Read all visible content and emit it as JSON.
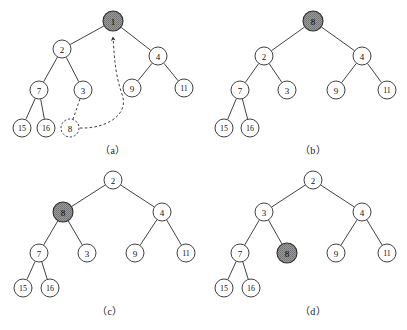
{
  "figure": {
    "width": 407,
    "height": 330,
    "background_color": "#ffffff",
    "line_color": "#2b2b2b",
    "shaded_node_fill": "#8c8c8c",
    "plain_node_fill": "#ffffff"
  },
  "panels": [
    {
      "id": "a",
      "caption": "（a）",
      "caption_x": 113,
      "caption_y": 150,
      "nodes": [
        {
          "id": "a-root",
          "label": "1",
          "x": 113,
          "y": 21,
          "r": 10,
          "style": "shaded"
        },
        {
          "id": "a-n2",
          "label": "2",
          "x": 62,
          "y": 49,
          "r": 9,
          "style": "plain"
        },
        {
          "id": "a-n4",
          "label": "4",
          "x": 158,
          "y": 56,
          "r": 9,
          "style": "plain"
        },
        {
          "id": "a-n7",
          "label": "7",
          "x": 39,
          "y": 90,
          "r": 9,
          "style": "plain"
        },
        {
          "id": "a-n3",
          "label": "3",
          "x": 83,
          "y": 90,
          "r": 9,
          "style": "plain"
        },
        {
          "id": "a-n9",
          "label": "9",
          "x": 132,
          "y": 88,
          "r": 9,
          "style": "plain"
        },
        {
          "id": "a-n11",
          "label": "11",
          "x": 184,
          "y": 88,
          "r": 9,
          "style": "plain"
        },
        {
          "id": "a-n15",
          "label": "15",
          "x": 22,
          "y": 128,
          "r": 9,
          "style": "plain"
        },
        {
          "id": "a-n16",
          "label": "16",
          "x": 46,
          "y": 128,
          "r": 9,
          "style": "plain"
        },
        {
          "id": "a-n8",
          "label": "8",
          "x": 70,
          "y": 128,
          "r": 9,
          "style": "dashed"
        }
      ],
      "edges": [
        {
          "from": "a-root",
          "to": "a-n2",
          "style": "solid"
        },
        {
          "from": "a-root",
          "to": "a-n4",
          "style": "solid"
        },
        {
          "from": "a-n2",
          "to": "a-n7",
          "style": "solid"
        },
        {
          "from": "a-n2",
          "to": "a-n3",
          "style": "solid"
        },
        {
          "from": "a-n4",
          "to": "a-n9",
          "style": "solid"
        },
        {
          "from": "a-n4",
          "to": "a-n11",
          "style": "solid"
        },
        {
          "from": "a-n7",
          "to": "a-n15",
          "style": "solid"
        },
        {
          "from": "a-n7",
          "to": "a-n16",
          "style": "solid"
        },
        {
          "from": "a-n3",
          "to": "a-n8",
          "style": "dashed"
        }
      ],
      "arrow": {
        "label": "sift-up-arrow",
        "description": "dashed curved arrow from node 8 up to the shaded root node 1",
        "from": "a-n8",
        "to": "a-root"
      }
    },
    {
      "id": "b",
      "caption": "（b）",
      "caption_x": 313,
      "caption_y": 150,
      "nodes": [
        {
          "id": "b-root",
          "label": "8",
          "x": 313,
          "y": 21,
          "r": 10,
          "style": "shaded"
        },
        {
          "id": "b-n2",
          "label": "2",
          "x": 264,
          "y": 56,
          "r": 9,
          "style": "plain"
        },
        {
          "id": "b-n4",
          "label": "4",
          "x": 362,
          "y": 56,
          "r": 9,
          "style": "plain"
        },
        {
          "id": "b-n7",
          "label": "7",
          "x": 240,
          "y": 90,
          "r": 9,
          "style": "plain"
        },
        {
          "id": "b-n3",
          "label": "3",
          "x": 287,
          "y": 90,
          "r": 9,
          "style": "plain"
        },
        {
          "id": "b-n9",
          "label": "9",
          "x": 336,
          "y": 90,
          "r": 9,
          "style": "plain"
        },
        {
          "id": "b-n11",
          "label": "11",
          "x": 387,
          "y": 90,
          "r": 9,
          "style": "plain"
        },
        {
          "id": "b-n15",
          "label": "15",
          "x": 224,
          "y": 128,
          "r": 9,
          "style": "plain"
        },
        {
          "id": "b-n16",
          "label": "16",
          "x": 250,
          "y": 128,
          "r": 9,
          "style": "plain"
        }
      ],
      "edges": [
        {
          "from": "b-root",
          "to": "b-n2",
          "style": "solid"
        },
        {
          "from": "b-root",
          "to": "b-n4",
          "style": "solid"
        },
        {
          "from": "b-n2",
          "to": "b-n7",
          "style": "solid"
        },
        {
          "from": "b-n2",
          "to": "b-n3",
          "style": "solid"
        },
        {
          "from": "b-n4",
          "to": "b-n9",
          "style": "solid"
        },
        {
          "from": "b-n4",
          "to": "b-n11",
          "style": "solid"
        },
        {
          "from": "b-n7",
          "to": "b-n15",
          "style": "solid"
        },
        {
          "from": "b-n7",
          "to": "b-n16",
          "style": "solid"
        }
      ],
      "arrow": null
    },
    {
      "id": "c",
      "caption": "（c）",
      "caption_x": 110,
      "caption_y": 311,
      "nodes": [
        {
          "id": "c-root",
          "label": "2",
          "x": 113,
          "y": 180,
          "r": 9,
          "style": "plain"
        },
        {
          "id": "c-n8",
          "label": "8",
          "x": 63,
          "y": 212,
          "r": 10,
          "style": "shaded"
        },
        {
          "id": "c-n4",
          "label": "4",
          "x": 162,
          "y": 212,
          "r": 9,
          "style": "plain"
        },
        {
          "id": "c-n7",
          "label": "7",
          "x": 39,
          "y": 253,
          "r": 9,
          "style": "plain"
        },
        {
          "id": "c-n3",
          "label": "3",
          "x": 87,
          "y": 253,
          "r": 9,
          "style": "plain"
        },
        {
          "id": "c-n9",
          "label": "9",
          "x": 135,
          "y": 253,
          "r": 9,
          "style": "plain"
        },
        {
          "id": "c-n11",
          "label": "11",
          "x": 186,
          "y": 253,
          "r": 9,
          "style": "plain"
        },
        {
          "id": "c-n15",
          "label": "15",
          "x": 23,
          "y": 288,
          "r": 9,
          "style": "plain"
        },
        {
          "id": "c-n16",
          "label": "16",
          "x": 50,
          "y": 288,
          "r": 9,
          "style": "plain"
        }
      ],
      "edges": [
        {
          "from": "c-root",
          "to": "c-n8",
          "style": "solid"
        },
        {
          "from": "c-root",
          "to": "c-n4",
          "style": "solid"
        },
        {
          "from": "c-n8",
          "to": "c-n7",
          "style": "solid"
        },
        {
          "from": "c-n8",
          "to": "c-n3",
          "style": "solid"
        },
        {
          "from": "c-n4",
          "to": "c-n9",
          "style": "solid"
        },
        {
          "from": "c-n4",
          "to": "c-n11",
          "style": "solid"
        },
        {
          "from": "c-n7",
          "to": "c-n15",
          "style": "solid"
        },
        {
          "from": "c-n7",
          "to": "c-n16",
          "style": "solid"
        }
      ],
      "arrow": null
    },
    {
      "id": "d",
      "caption": "（d）",
      "caption_x": 313,
      "caption_y": 311,
      "nodes": [
        {
          "id": "d-root",
          "label": "2",
          "x": 313,
          "y": 180,
          "r": 9,
          "style": "plain"
        },
        {
          "id": "d-n3",
          "label": "3",
          "x": 264,
          "y": 212,
          "r": 9,
          "style": "plain"
        },
        {
          "id": "d-n4",
          "label": "4",
          "x": 362,
          "y": 212,
          "r": 9,
          "style": "plain"
        },
        {
          "id": "d-n7",
          "label": "7",
          "x": 240,
          "y": 253,
          "r": 9,
          "style": "plain"
        },
        {
          "id": "d-n8",
          "label": "8",
          "x": 287,
          "y": 253,
          "r": 10,
          "style": "shaded"
        },
        {
          "id": "d-n9",
          "label": "9",
          "x": 336,
          "y": 253,
          "r": 9,
          "style": "plain"
        },
        {
          "id": "d-n11",
          "label": "11",
          "x": 387,
          "y": 253,
          "r": 9,
          "style": "plain"
        },
        {
          "id": "d-n15",
          "label": "15",
          "x": 224,
          "y": 288,
          "r": 9,
          "style": "plain"
        },
        {
          "id": "d-n16",
          "label": "16",
          "x": 251,
          "y": 288,
          "r": 9,
          "style": "plain"
        }
      ],
      "edges": [
        {
          "from": "d-root",
          "to": "d-n3",
          "style": "solid"
        },
        {
          "from": "d-root",
          "to": "d-n4",
          "style": "solid"
        },
        {
          "from": "d-n3",
          "to": "d-n7",
          "style": "solid"
        },
        {
          "from": "d-n3",
          "to": "d-n8",
          "style": "solid"
        },
        {
          "from": "d-n4",
          "to": "d-n9",
          "style": "solid"
        },
        {
          "from": "d-n4",
          "to": "d-n11",
          "style": "solid"
        },
        {
          "from": "d-n7",
          "to": "d-n15",
          "style": "solid"
        },
        {
          "from": "d-n7",
          "to": "d-n16",
          "style": "solid"
        }
      ],
      "arrow": null
    }
  ]
}
